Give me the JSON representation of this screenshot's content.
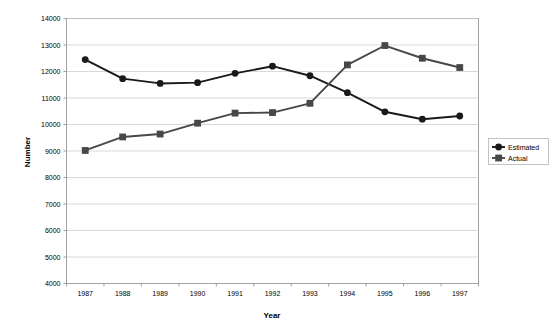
{
  "chart_data": {
    "type": "line",
    "title": "",
    "xlabel": "Year",
    "ylabel": "Number",
    "categories": [
      "1987",
      "1988",
      "1989",
      "1990",
      "1991",
      "1992",
      "1993",
      "1994",
      "1995",
      "1996",
      "1997"
    ],
    "ylim": [
      4000,
      14000
    ],
    "ytick_step": 1000,
    "yticks": [
      "4000",
      "5000",
      "6000",
      "7000",
      "8000",
      "9000",
      "10000",
      "11000",
      "12000",
      "13000",
      "14000"
    ],
    "grid": "horizontal",
    "legend_position": "right",
    "series": [
      {
        "name": "Estimated",
        "marker": "circle",
        "color": "#1a1a1a",
        "values": [
          12450,
          11730,
          11550,
          11580,
          11930,
          12200,
          11840,
          11200,
          10480,
          10200,
          10320
        ]
      },
      {
        "name": "Actual",
        "marker": "square",
        "color": "#474747",
        "values": [
          9020,
          9530,
          9640,
          10050,
          10430,
          10450,
          10800,
          12250,
          12980,
          12500,
          12150
        ]
      }
    ]
  },
  "legend": {
    "items": [
      {
        "label": "Estimated"
      },
      {
        "label": "Actual"
      }
    ]
  },
  "axes": {
    "x_title": "Year",
    "y_title": "Number"
  }
}
